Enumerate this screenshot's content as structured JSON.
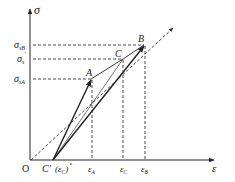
{
  "diagram": {
    "type": "stress-strain",
    "axes": {
      "y_label": "σ",
      "x_label": "ε",
      "origin_label": "O"
    },
    "y_ticks": [
      {
        "main": "σ",
        "sub": "sB",
        "sup": ""
      },
      {
        "main": "σ",
        "sub": "s",
        "sup": "′"
      },
      {
        "main": "σ",
        "sub": "sA",
        "sup": ""
      }
    ],
    "x_ticks": [
      {
        "main": "ε",
        "sub": "A"
      },
      {
        "main": "ε",
        "sub": "C"
      },
      {
        "main": "ε",
        "sub": "B"
      }
    ],
    "points": {
      "A": "A",
      "B": "B",
      "C": "C",
      "C_prime": "C′",
      "C_prime_paren": "(ε",
      "C_prime_paren_sub": "C",
      "C_prime_paren_sup": "*",
      "C_prime_paren_close": ")"
    },
    "colors": {
      "line": "#222222",
      "dashed": "#333333"
    }
  }
}
